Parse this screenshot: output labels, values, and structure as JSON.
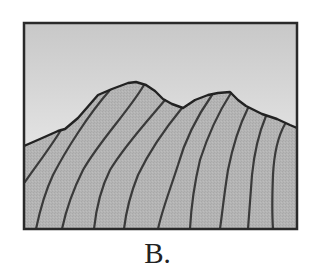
{
  "figure": {
    "label": "B.",
    "colors": {
      "sky_top": "#c9c9c9",
      "sky_bottom": "#f4f4f4",
      "mountain_fill": "#b3b3b3",
      "outline": "#2a2a2a",
      "frame": "#2a2a2a"
    }
  }
}
